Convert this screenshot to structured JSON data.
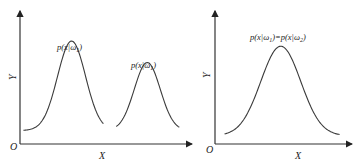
{
  "chart_data": [
    {
      "type": "line",
      "title": "",
      "xlabel": "X",
      "ylabel": "Y",
      "origin_label": "O",
      "grid": false,
      "series": [
        {
          "name": "p(x|ω1)",
          "label_main": "p(x|ω",
          "label_sub": "1",
          "label_close": ")",
          "shape": "gaussian",
          "center": 0.3,
          "relative_height": 1.0,
          "baseline": 0.13,
          "x_start": 0.02,
          "x_end": 0.49
        },
        {
          "name": "p(x|ω1)",
          "label_main": "p(x|ω",
          "label_sub": "1",
          "label_close": ")",
          "shape": "gaussian",
          "center": 0.74,
          "relative_height": 0.76,
          "baseline": 0.13,
          "x_start": 0.56,
          "x_end": 0.93
        }
      ]
    },
    {
      "type": "line",
      "title": "",
      "xlabel": "X",
      "ylabel": "Y",
      "origin_label": "O",
      "grid": false,
      "series": [
        {
          "name": "p(x|ω1)=p(x|ω2)",
          "label_parts": [
            "p(x|ω",
            "1",
            ")=p(x|ω",
            "2",
            ")"
          ],
          "shape": "gaussian",
          "center": 0.48,
          "relative_height": 1.0,
          "baseline": 0.08,
          "x_start": 0.07,
          "x_end": 0.91
        }
      ]
    }
  ]
}
